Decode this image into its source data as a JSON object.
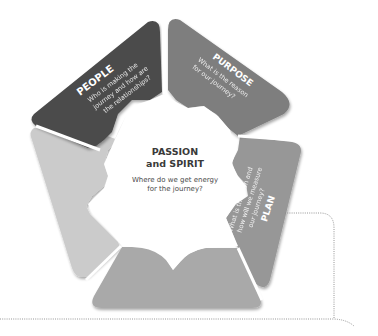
{
  "diagram": {
    "center": {
      "title_line1": "PASSION",
      "title_line2": "and SPIRIT",
      "question_line1": "Where do we get energy",
      "question_line2": "for the journey?"
    },
    "segments": [
      {
        "id": "people",
        "title": "PEOPLE",
        "question_lines": [
          "Who is making the",
          "journey and how are",
          "the relationships?"
        ],
        "color": "#4b4b4b"
      },
      {
        "id": "purpose",
        "title": "PURPOSE",
        "question_lines": [
          "What is the reason",
          "for our journey?"
        ],
        "color": "#7e7e7e"
      },
      {
        "id": "plan",
        "title": "PLAN",
        "question_lines": [
          "What is the plan and",
          "how will we measure",
          "our journey?"
        ],
        "color": "#979797"
      },
      {
        "id": "bottom",
        "title": "",
        "question_lines": [],
        "color": "#a9a9a9"
      },
      {
        "id": "left",
        "title": "",
        "question_lines": [],
        "color": "#cbcbcb"
      }
    ],
    "center_color": "#ffffff",
    "connector_color": "#8a8a8a"
  }
}
